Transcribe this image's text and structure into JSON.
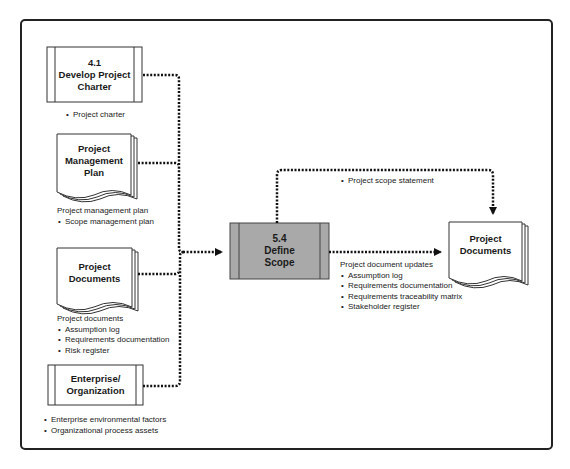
{
  "diagram": {
    "process": {
      "number": "5.4",
      "name_line1": "Define",
      "name_line2": "Scope",
      "fill": "#a9a9a9"
    },
    "inputs": [
      {
        "id": "develop-project-charter",
        "shape": "process-box",
        "title_line1": "4.1",
        "title_line2": "Develop Project",
        "title_line3": "Charter",
        "items_heading": "",
        "items": [
          "Project charter"
        ]
      },
      {
        "id": "project-management-plan",
        "shape": "document-stack",
        "title_line1": "Project",
        "title_line2": "Management",
        "title_line3": "Plan",
        "items_heading": "Project management plan",
        "items": [
          "Scope management plan"
        ]
      },
      {
        "id": "project-documents-input",
        "shape": "document-stack",
        "title_line1": "Project",
        "title_line2": "Documents",
        "items_heading": "Project documents",
        "items": [
          "Assumption log",
          "Requirements documentation",
          "Risk register"
        ]
      },
      {
        "id": "enterprise-organization",
        "shape": "process-box",
        "title_line1": "Enterprise/",
        "title_line2": "Organization",
        "items_heading": "",
        "items": [
          "Enterprise environmental factors",
          "Organizational process assets"
        ]
      }
    ],
    "outputs": [
      {
        "id": "project-documents-output",
        "shape": "document-stack",
        "title_line1": "Project",
        "title_line2": "Documents"
      }
    ],
    "flows": {
      "scope_statement": {
        "items": [
          "Project scope statement"
        ]
      },
      "document_updates": {
        "heading": "Project document updates",
        "items": [
          "Assumption log",
          "Requirements documentation",
          "Requirements traceability matrix",
          "Stakeholder register"
        ]
      }
    }
  }
}
